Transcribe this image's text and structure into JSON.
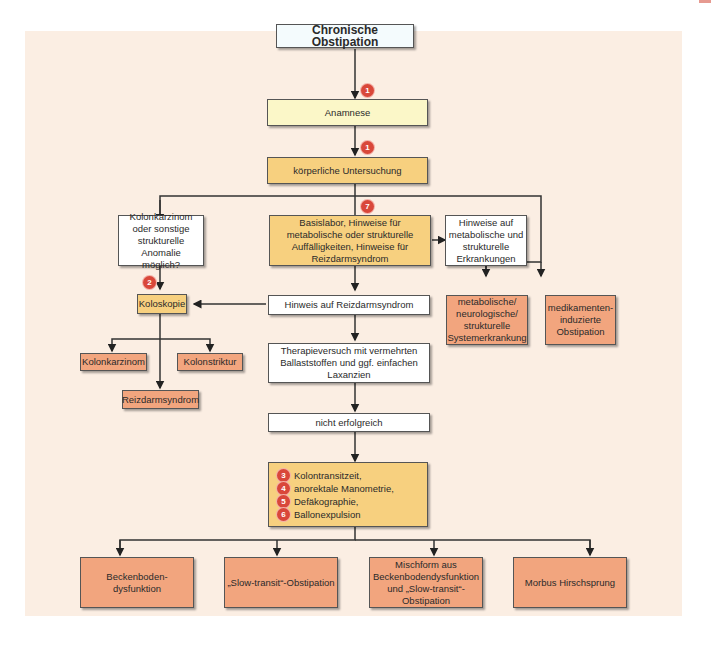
{
  "header": {
    "left_text": "",
    "right_text": ""
  },
  "colors": {
    "panel_background": "#fbeee3",
    "white_box": "#ffffff",
    "light_yellow_box": "#fbf7c8",
    "yellow_box": "#f7d07f",
    "orange_box": "#f2a57e",
    "badge": "#d9473a",
    "line": "#333333"
  },
  "flowchart": {
    "title": "Chronische Obstipation",
    "nodes": {
      "anamnese": {
        "label": "Anamnese",
        "badge": "1"
      },
      "koerperliche_untersuchung": {
        "label": "körperliche Untersuchung",
        "badge": "1"
      },
      "basislabor": {
        "label": "Basislabor, Hinweise für metabolische oder strukturelle Auffälligkeiten, Hinweise für Reizdarmsyndrom",
        "badge": "7"
      },
      "kolonkarzinom_frage": {
        "label": "Kolonkarzinom oder sonstige strukturelle Anomalie möglich?"
      },
      "hinweise_metabolisch": {
        "label": "Hinweise auf metabolische und strukturelle Erkrankungen"
      },
      "koloskopie": {
        "label": "Koloskopie",
        "badge": "2"
      },
      "hinweis_reizdarm": {
        "label": "Hinweis auf Reizdarmsyndrom"
      },
      "metabolische_systemerkrankung": {
        "label": "metabolische/ neurologische/ strukturelle Systemerkrankung"
      },
      "medikamenten_obstipation": {
        "label": "medikamenten-induzierte Obstipation"
      },
      "kolonkarzinom": {
        "label": "Kolonkarzinom"
      },
      "kolonstriktur": {
        "label": "Kolonstriktur"
      },
      "reizdarmsyndrom": {
        "label": "Reizdarmsyndrom"
      },
      "therapieversuch": {
        "label": "Therapieversuch mit vermehrten Ballaststoffen und ggf. einfachen Laxanzien"
      },
      "nicht_erfolgreich": {
        "label": "nicht erfolgreich"
      },
      "diagnostik": {
        "items": [
          {
            "badge": "3",
            "label": "Kolontransitzeit,"
          },
          {
            "badge": "4",
            "label": "anorektale Manometrie,"
          },
          {
            "badge": "5",
            "label": "Defäkographie,"
          },
          {
            "badge": "6",
            "label": "Ballonexpulsion"
          }
        ]
      },
      "beckenboden": {
        "label": "Beckenboden-dysfunktion"
      },
      "slow_transit": {
        "label": "„Slow-transit“-Obstipation"
      },
      "mischform": {
        "label": "Mischform aus Beckenbodendysfunktion und „Slow-transit“-Obstipation"
      },
      "hirschsprung": {
        "label": "Morbus Hirschsprung"
      }
    }
  }
}
